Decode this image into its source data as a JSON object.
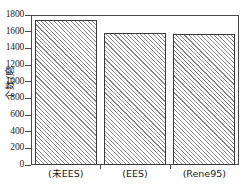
{
  "chart_data": {
    "type": "bar",
    "title": "",
    "xlabel": "",
    "ylabel": "个数/磨",
    "categories": [
      "(未EES)",
      "(EES)",
      "(Rene95)"
    ],
    "values": [
      1745,
      1580,
      1570
    ],
    "ylim": [
      0,
      1800
    ],
    "yticks": [
      0,
      200,
      400,
      600,
      800,
      1000,
      1200,
      1400,
      1600,
      1800
    ],
    "ytick_labels": [
      "0",
      "200",
      "400",
      "600",
      "800",
      "1000",
      "1200",
      "1400",
      "1600",
      "1800"
    ],
    "grid": false,
    "legend": null,
    "bar_fill": "hatch-forward-diagonal",
    "bar_edge_color": "#3a3a3a",
    "hatch_color": "#8a8a8a",
    "frame_color": "#4a4a4a",
    "background": "#ffffff"
  }
}
